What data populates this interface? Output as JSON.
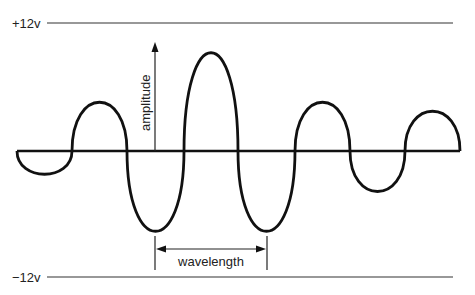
{
  "diagram": {
    "title": "",
    "labels": {
      "top_voltage": "+12v",
      "bottom_voltage": "−12v",
      "amplitude": "amplitude",
      "wavelength": "wavelength"
    },
    "colors": {
      "stroke": "#111111",
      "rail": "#333333",
      "background": "#ffffff"
    },
    "rails": {
      "top": {
        "label": "+12v",
        "y": 23
      },
      "bottom": {
        "label": "−12v",
        "y": 277
      },
      "baseline_y": 151
    },
    "wave_lobes": [
      {
        "x_start": 17,
        "x_end": 72,
        "direction": "down",
        "extreme_y": 175
      },
      {
        "x_start": 72,
        "x_end": 127,
        "direction": "up",
        "extreme_y": 96
      },
      {
        "x_start": 127,
        "x_end": 184,
        "direction": "down",
        "extreme_y": 229
      },
      {
        "x_start": 184,
        "x_end": 238,
        "direction": "up",
        "extreme_y": 44
      },
      {
        "x_start": 238,
        "x_end": 295,
        "direction": "down",
        "extreme_y": 229
      },
      {
        "x_start": 295,
        "x_end": 350,
        "direction": "up",
        "extreme_y": 96
      },
      {
        "x_start": 350,
        "x_end": 405,
        "direction": "down",
        "extreme_y": 192
      },
      {
        "x_start": 405,
        "x_end": 460,
        "direction": "up",
        "extreme_y": 110
      }
    ],
    "amplitude_arrow": {
      "x": 155,
      "y_from": 151,
      "y_to": 43
    },
    "wavelength_marker": {
      "x_left": 155,
      "x_right": 267,
      "arrow_y": 249
    }
  }
}
